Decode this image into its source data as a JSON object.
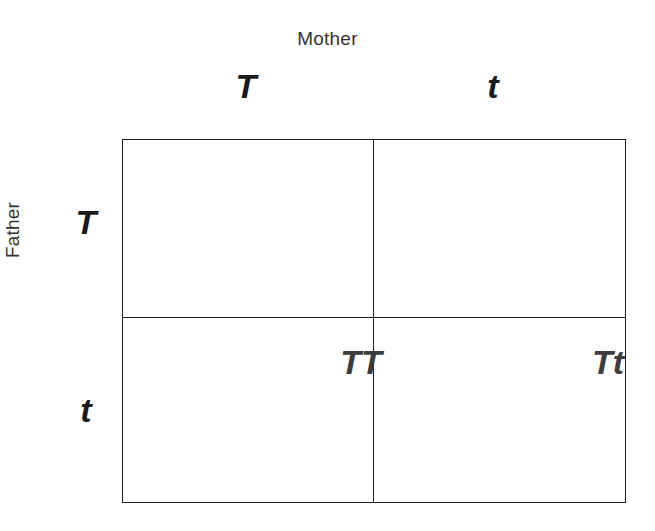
{
  "diagram": {
    "type": "punnett-square",
    "title": "",
    "axes": {
      "top": {
        "parent_label": "Mother",
        "alleles": [
          "T",
          "t"
        ]
      },
      "left": {
        "parent_label": "Father",
        "alleles": [
          "T",
          "t"
        ]
      }
    },
    "grid": {
      "rows": 2,
      "columns": 2,
      "cells": [
        [
          "TT",
          "Tt"
        ],
        [
          "tT",
          "tt"
        ]
      ]
    },
    "colors": {
      "background": "#ffffff",
      "grid_line": "#1d1d1d",
      "allele_header_text": "#1a1a1a",
      "cell_text": "#3c3c3c",
      "axis_label_text": "#333333"
    }
  }
}
